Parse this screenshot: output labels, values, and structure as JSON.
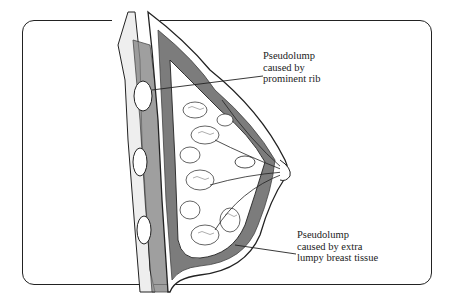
{
  "diagram": {
    "labels": [
      {
        "id": "rib",
        "text": "Pseudolump\ncaused by\nprominent rib"
      },
      {
        "id": "tissue",
        "text": "Pseudolump\ncaused by extra\nlumpy breast tissue"
      }
    ],
    "colors": {
      "line": "#222222",
      "background": "#ffffff",
      "shade": "#555555"
    }
  }
}
